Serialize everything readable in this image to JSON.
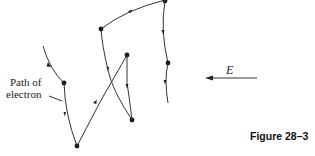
{
  "figure": {
    "caption": "Figure 28–3",
    "path_label_line1": "Path of",
    "path_label_line2": "electron",
    "field_label": "E",
    "field_direction": "left",
    "colors": {
      "line": "#333333",
      "dot": "#1a1a1a",
      "background": "#ffffff"
    }
  }
}
